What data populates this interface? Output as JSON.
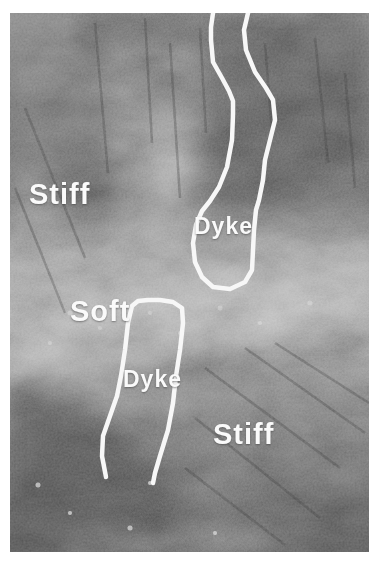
{
  "figure": {
    "labels": {
      "stiff_upper": "Stiff",
      "soft": "Soft",
      "dyke_upper": "Dyke",
      "dyke_lower": "Dyke",
      "stiff_lower": "Stiff"
    },
    "colors": {
      "annotation_outline": "#f7f7f7",
      "label_text": "#fafafa",
      "page_background": "#ffffff"
    }
  }
}
